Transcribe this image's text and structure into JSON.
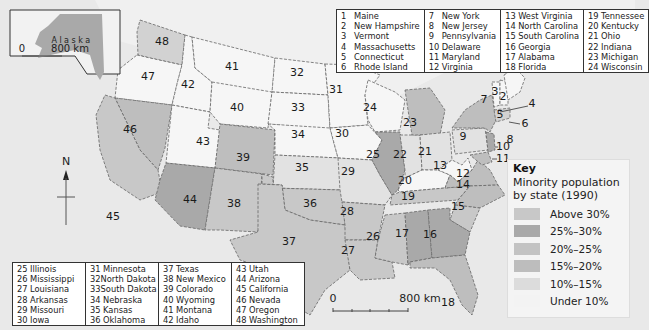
{
  "map": {
    "inset_label": "Alaska",
    "inset_scale": {
      "start": "0",
      "end": "800 km"
    },
    "main_scale": {
      "start": "0",
      "end": "800 km"
    },
    "north_arrow": "N",
    "state_numbers": [
      "1",
      "2",
      "3",
      "4",
      "5",
      "6",
      "7",
      "8",
      "9",
      "10",
      "11",
      "12",
      "13",
      "14",
      "15",
      "16",
      "17",
      "18",
      "19",
      "20",
      "21",
      "22",
      "23",
      "24",
      "25",
      "26",
      "27",
      "28",
      "29",
      "30",
      "31",
      "32",
      "33",
      "34",
      "35",
      "36",
      "37",
      "38",
      "39",
      "40",
      "41",
      "42",
      "43",
      "44",
      "45",
      "46",
      "47",
      "48"
    ]
  },
  "legend_top": {
    "columns": [
      [
        {
          "n": "1",
          "s": "Maine"
        },
        {
          "n": "2",
          "s": "New Hampshire"
        },
        {
          "n": "3",
          "s": "Vermont"
        },
        {
          "n": "4",
          "s": "Massachusetts"
        },
        {
          "n": "5",
          "s": "Connecticut"
        },
        {
          "n": "6",
          "s": "Rhode Island"
        }
      ],
      [
        {
          "n": "7",
          "s": "New York"
        },
        {
          "n": "8",
          "s": "New Jersey"
        },
        {
          "n": "9",
          "s": "Pennsylvania"
        },
        {
          "n": "10",
          "s": "Delaware"
        },
        {
          "n": "11",
          "s": "Maryland"
        },
        {
          "n": "12",
          "s": "Virginia"
        }
      ],
      [
        {
          "n": "13",
          "s": "West Virginia"
        },
        {
          "n": "14",
          "s": "North Carolina"
        },
        {
          "n": "15",
          "s": "South Carolina"
        },
        {
          "n": "16",
          "s": "Georgia"
        },
        {
          "n": "17",
          "s": "Alabama"
        },
        {
          "n": "18",
          "s": "Florida"
        }
      ],
      [
        {
          "n": "19",
          "s": "Tennessee"
        },
        {
          "n": "20",
          "s": "Kentucky"
        },
        {
          "n": "21",
          "s": "Ohio"
        },
        {
          "n": "22",
          "s": "Indiana"
        },
        {
          "n": "23",
          "s": "Michigan"
        },
        {
          "n": "24",
          "s": "Wisconsin"
        }
      ]
    ]
  },
  "legend_bottom": {
    "columns": [
      [
        {
          "n": "25",
          "s": "Illinois"
        },
        {
          "n": "26",
          "s": "Mississippi"
        },
        {
          "n": "27",
          "s": "Louisiana"
        },
        {
          "n": "28",
          "s": "Arkansas"
        },
        {
          "n": "29",
          "s": "Missouri"
        },
        {
          "n": "30",
          "s": "Iowa"
        }
      ],
      [
        {
          "n": "31",
          "s": "Minnesota"
        },
        {
          "n": "32",
          "s": "North Dakota"
        },
        {
          "n": "33",
          "s": "South Dakota"
        },
        {
          "n": "34",
          "s": "Nebraska"
        },
        {
          "n": "35",
          "s": "Kansas"
        },
        {
          "n": "36",
          "s": "Oklahoma"
        }
      ],
      [
        {
          "n": "37",
          "s": "Texas"
        },
        {
          "n": "38",
          "s": "New Mexico"
        },
        {
          "n": "39",
          "s": "Colorado"
        },
        {
          "n": "40",
          "s": "Wyoming"
        },
        {
          "n": "41",
          "s": "Montana"
        },
        {
          "n": "42",
          "s": "Idaho"
        }
      ],
      [
        {
          "n": "43",
          "s": "Utah"
        },
        {
          "n": "44",
          "s": "Arizona"
        },
        {
          "n": "45",
          "s": "California"
        },
        {
          "n": "46",
          "s": "Nevada"
        },
        {
          "n": "47",
          "s": "Oregon"
        },
        {
          "n": "48",
          "s": "Washington"
        }
      ]
    ]
  },
  "key": {
    "title": "Key",
    "subtitle": "Minority population by state (1990)",
    "items": [
      {
        "label": "Above 30%",
        "color": "#c8c8c8"
      },
      {
        "label": "25%–30%",
        "color": "#a9a9a9"
      },
      {
        "label": "20%–25%",
        "color": "#c3c3c3"
      },
      {
        "label": "15%–20%",
        "color": "#bdbdbd"
      },
      {
        "label": "10%–15%",
        "color": "#dcdcdc"
      },
      {
        "label": "Under 10%",
        "color": "#f3f3f3"
      }
    ]
  },
  "colors": {
    "ocean": "#e9e9e9",
    "border": "#555555",
    "dark": "#a9a9a9",
    "mid": "#bebebe",
    "light": "#d2d2d2",
    "pale": "#e2e2e2",
    "white": "#f6f6f6"
  }
}
